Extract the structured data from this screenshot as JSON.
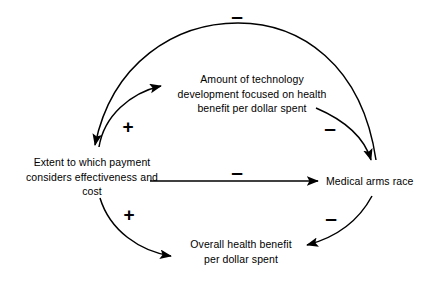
{
  "diagram": {
    "type": "causal-loop-diagram",
    "stroke_color": "#000000",
    "background_color": "#ffffff",
    "nodes": [
      {
        "id": "payment",
        "label": "Extent to which payment\nconsiders effectiveness and\ncost"
      },
      {
        "id": "technology",
        "label": "Amount of technology\ndevelopment focused on health\nbenefit per dollar spent"
      },
      {
        "id": "arms_race",
        "label": "Medical arms race"
      },
      {
        "id": "benefit",
        "label": "Overall health benefit\nper dollar spent"
      }
    ],
    "links": [
      {
        "id": "arms-race-to-payment",
        "from": "arms_race",
        "to": "payment",
        "polarity": "-",
        "shape": "arc-over-top"
      },
      {
        "id": "payment-to-technology",
        "from": "payment",
        "to": "technology",
        "polarity": "+",
        "shape": "arc-upper-left"
      },
      {
        "id": "technology-to-arms-race",
        "from": "technology",
        "to": "arms_race",
        "polarity": "-",
        "shape": "arc-upper-right"
      },
      {
        "id": "payment-to-arms-race",
        "from": "payment",
        "to": "arms_race",
        "polarity": "-",
        "shape": "straight-horizontal"
      },
      {
        "id": "payment-to-benefit",
        "from": "payment",
        "to": "benefit",
        "polarity": "+",
        "shape": "arc-lower-left"
      },
      {
        "id": "arms-race-to-benefit",
        "from": "arms_race",
        "to": "benefit",
        "polarity": "-",
        "shape": "arc-lower-right"
      }
    ],
    "polarity_markers": [
      {
        "id": "top-minus",
        "symbol": "–",
        "link": "arms-race-to-payment"
      },
      {
        "id": "upper-left-plus",
        "symbol": "+",
        "link": "payment-to-technology"
      },
      {
        "id": "upper-right-minus",
        "symbol": "–",
        "link": "technology-to-arms-race"
      },
      {
        "id": "center-minus",
        "symbol": "–",
        "link": "payment-to-arms-race"
      },
      {
        "id": "lower-left-plus",
        "symbol": "+",
        "link": "payment-to-benefit"
      },
      {
        "id": "lower-right-minus",
        "symbol": "–",
        "link": "arms-race-to-benefit"
      }
    ]
  }
}
